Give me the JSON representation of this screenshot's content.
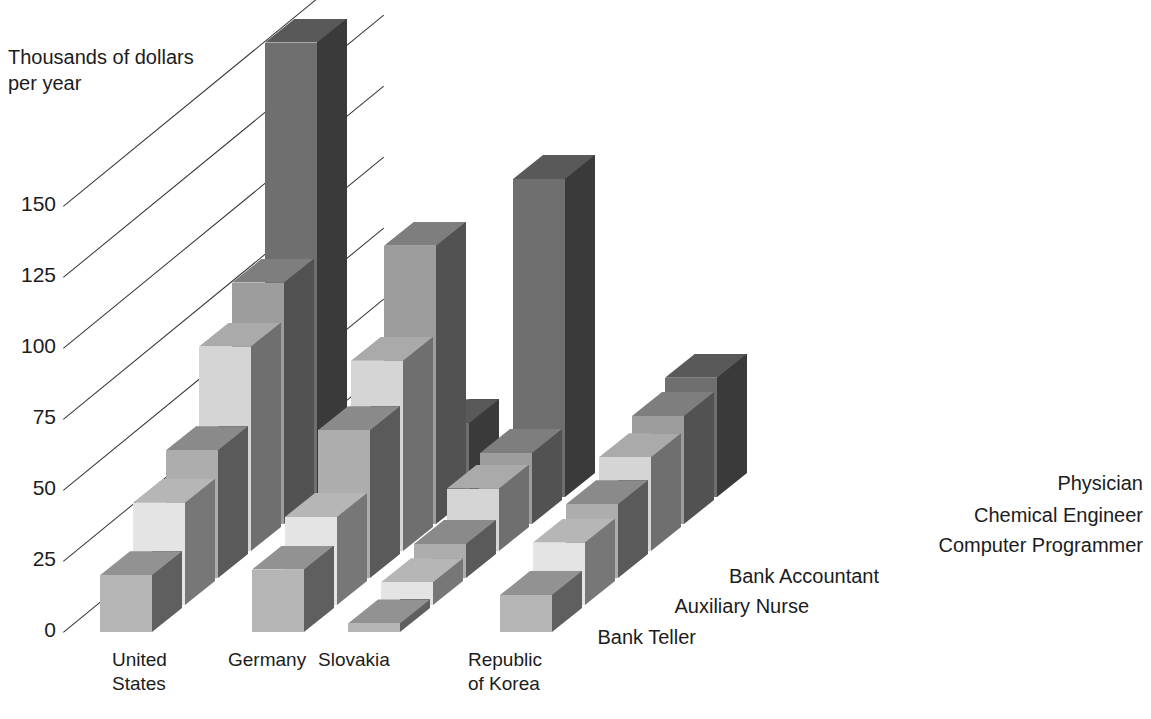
{
  "axis": {
    "caption": "Thousands of dollars\nper year",
    "ticks": [
      "150",
      "125",
      "100",
      "75",
      "50",
      "25",
      "0"
    ],
    "tick_values": [
      150,
      125,
      100,
      75,
      50,
      25,
      0
    ]
  },
  "series_labels": [
    "Physician",
    "Chemical Engineer",
    "Computer Programmer",
    "Bank Accountant",
    "Auxiliary Nurse",
    "Bank Teller"
  ],
  "category_labels": [
    "United\nStates",
    "Germany",
    "Slovakia",
    "Republic\nof Korea"
  ],
  "colors": {
    "bank_teller": "#b6b6b6",
    "auxiliary_nurse": "#e4e4e4",
    "bank_accountant": "#adadad",
    "computer_programmer": "#d5d5d5",
    "chemical_engineer": "#9d9d9d",
    "physician": "#6f6f6f",
    "gridline": "#333333",
    "text": "#1c1c1c",
    "background": "#ffffff"
  },
  "chart_data": {
    "type": "bar",
    "title": "",
    "subtype": "3d-grouped-bar",
    "xlabel": "",
    "ylabel": "Thousands of dollars per year",
    "ylim": [
      0,
      175
    ],
    "yticks": [
      0,
      25,
      50,
      75,
      100,
      125,
      150
    ],
    "grid": true,
    "legend": "right-inline",
    "categories": [
      "United States",
      "Germany",
      "Slovakia",
      "Republic of Korea"
    ],
    "series": [
      {
        "name": "Bank Teller",
        "values": [
          20,
          22,
          3,
          13
        ]
      },
      {
        "name": "Auxiliary Nurse",
        "values": [
          36,
          31,
          8,
          22
        ]
      },
      {
        "name": "Bank Accountant",
        "values": [
          45,
          52,
          12,
          26
        ]
      },
      {
        "name": "Computer Programmer",
        "values": [
          72,
          67,
          22,
          33
        ]
      },
      {
        "name": "Chemical Engineer",
        "values": [
          85,
          98,
          25,
          38
        ]
      },
      {
        "name": "Physician",
        "values": [
          160,
          26,
          112,
          42
        ]
      }
    ]
  }
}
